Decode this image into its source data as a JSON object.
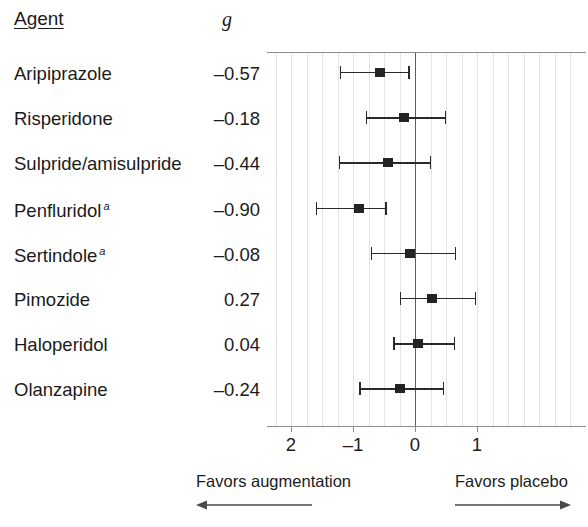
{
  "figure": {
    "columns": {
      "agent_header": "Agent",
      "effect_header": "g"
    },
    "footnote_marker": "a"
  },
  "chart_data": {
    "type": "scatter",
    "subtype": "forest-plot",
    "title": "",
    "xlabel": "",
    "ylabel": "",
    "xlim": [
      -2.4,
      2.74
    ],
    "xticks": [
      -2,
      -1,
      0,
      1
    ],
    "xticklabels": [
      "2",
      "–1",
      "0",
      "1"
    ],
    "grid": true,
    "reference_line": 0,
    "legend": "none",
    "categories": [
      "Aripiprazole",
      "Risperidone",
      "Sulpride/amisulpride",
      "Penfluridol",
      "Sertindole",
      "Pimozide",
      "Haloperidol",
      "Olanzapine"
    ],
    "values": [
      -0.57,
      -0.18,
      -0.44,
      -0.9,
      -0.08,
      0.27,
      0.04,
      -0.24
    ],
    "ci_low": [
      -1.21,
      -0.79,
      -1.23,
      -1.6,
      -0.71,
      -0.25,
      -0.35,
      -0.9
    ],
    "ci_high": [
      -0.11,
      0.48,
      0.24,
      -0.48,
      0.64,
      0.97,
      0.63,
      0.45
    ],
    "annotations": {
      "left_direction": "Favors augmentation",
      "right_direction": "Favors placebo"
    },
    "rows": [
      {
        "label": "Aripiprazole",
        "value": "–0.57",
        "footnote": false,
        "g": -0.57,
        "lo": -1.21,
        "hi": -0.11
      },
      {
        "label": "Risperidone",
        "value": "–0.18",
        "footnote": false,
        "g": -0.18,
        "lo": -0.79,
        "hi": 0.48
      },
      {
        "label": "Sulpride/amisulpride",
        "value": "–0.44",
        "footnote": false,
        "g": -0.44,
        "lo": -1.23,
        "hi": 0.24
      },
      {
        "label": "Penfluridol",
        "value": "–0.90",
        "footnote": true,
        "g": -0.9,
        "lo": -1.6,
        "hi": -0.48
      },
      {
        "label": "Sertindole",
        "value": "–0.08",
        "footnote": true,
        "g": -0.08,
        "lo": -0.71,
        "hi": 0.64
      },
      {
        "label": "Pimozide",
        "value": "0.27",
        "footnote": false,
        "g": 0.27,
        "lo": -0.25,
        "hi": 0.97
      },
      {
        "label": "Haloperidol",
        "value": "0.04",
        "footnote": false,
        "g": 0.04,
        "lo": -0.35,
        "hi": 0.63
      },
      {
        "label": "Olanzapine",
        "value": "–0.24",
        "footnote": false,
        "g": -0.24,
        "lo": -0.9,
        "hi": 0.45
      }
    ]
  },
  "colors": {
    "marker": "#232323",
    "ci": "#2a2a2a",
    "gridline": "#e3e3e3",
    "axis": "#8d8d8d",
    "zero_line": "#5d5d5d",
    "text": "#1b1b1b",
    "background": "#ffffff"
  }
}
